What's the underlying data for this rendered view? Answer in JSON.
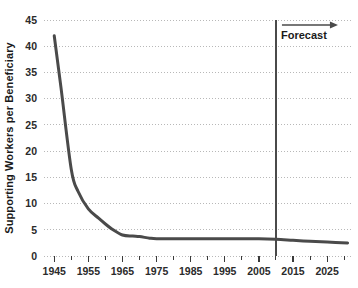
{
  "chart_data": {
    "type": "line",
    "title": "",
    "subtitle": "",
    "xlabel": "",
    "ylabel": "Supporting Workers per Beneficiary",
    "xlim": [
      1942,
      2032
    ],
    "ylim": [
      0,
      45
    ],
    "grid": "horizontal-dotted",
    "legend": "none",
    "y_ticks": [
      0,
      5,
      10,
      15,
      20,
      25,
      30,
      35,
      40,
      45
    ],
    "y_tick_labels": [
      "0",
      "5",
      "10",
      "15",
      "20",
      "25",
      "30",
      "35",
      "40",
      "45"
    ],
    "x_ticks": [
      1945,
      1955,
      1965,
      1975,
      1985,
      1995,
      2005,
      2015,
      2025
    ],
    "x_tick_labels": [
      "1945",
      "1955",
      "1965",
      "1975",
      "1985",
      "1995",
      "2005",
      "2015",
      "2025"
    ],
    "x_minor_ticks": [
      1950,
      1960,
      1970,
      1980,
      1990,
      2000,
      2010,
      2020,
      2030
    ],
    "series": [
      {
        "name": "Supporting Workers per Beneficiary",
        "color": "#4a4a4a",
        "line_width": 3,
        "x": [
          1945,
          1947,
          1950,
          1952,
          1955,
          1958,
          1960,
          1962,
          1965,
          1968,
          1970,
          1973,
          1975,
          1980,
          1985,
          1990,
          1995,
          2000,
          2005,
          2010,
          2015,
          2020,
          2025,
          2031
        ],
        "values": [
          42.0,
          32.0,
          16.5,
          12.3,
          9.0,
          7.2,
          6.1,
          5.1,
          4.0,
          3.8,
          3.7,
          3.4,
          3.3,
          3.3,
          3.3,
          3.3,
          3.3,
          3.3,
          3.3,
          3.2,
          3.0,
          2.8,
          2.65,
          2.5
        ]
      }
    ],
    "annotations": [
      {
        "name": "forecast-divider",
        "type": "vertical-line",
        "x": 2010,
        "color": "#4a4a4a",
        "label": "Forecast",
        "arrow": "right"
      }
    ]
  },
  "axis": {
    "y_title": "Supporting Workers per Beneficiary"
  },
  "annotation": {
    "forecast_label": "Forecast"
  },
  "colors": {
    "line": "#4a4a4a",
    "grid": "#b8b8b8",
    "axis": "#3a3a3a",
    "text": "#1a1a1a",
    "background": "#ffffff"
  }
}
